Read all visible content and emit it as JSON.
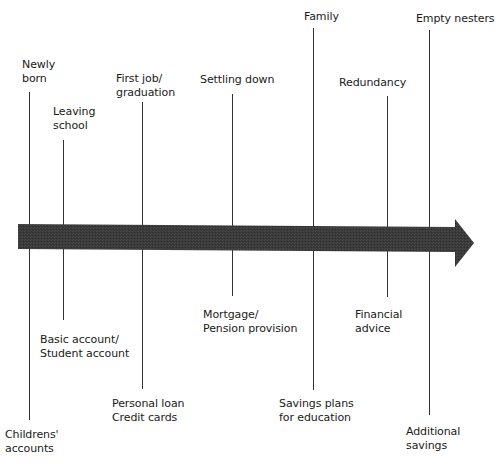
{
  "diagram": {
    "type": "life-stage timeline",
    "arrow_color": "#3a3a3a",
    "line_color": "#333333"
  },
  "stages": [
    {
      "id": "newly-born",
      "top": [
        "Newly",
        "born"
      ],
      "bottom": [
        "Childrens'",
        "accounts"
      ]
    },
    {
      "id": "leaving-school",
      "top": [
        "Leaving",
        "school"
      ],
      "bottom": [
        "Basic account/",
        "Student account"
      ]
    },
    {
      "id": "first-job",
      "top": [
        "First job/",
        "graduation"
      ],
      "bottom": [
        "Personal loan",
        "Credit cards"
      ]
    },
    {
      "id": "settling-down",
      "top": [
        "Settling down"
      ],
      "bottom": [
        "Mortgage/",
        "Pension provision"
      ]
    },
    {
      "id": "family",
      "top": [
        "Family"
      ],
      "bottom": [
        "Savings plans",
        "for education"
      ]
    },
    {
      "id": "redundancy",
      "top": [
        "Redundancy"
      ],
      "bottom": [
        "Financial",
        "advice"
      ]
    },
    {
      "id": "empty-nesters",
      "top": [
        "Empty nesters"
      ],
      "bottom": [
        "Additional",
        "savings"
      ]
    }
  ]
}
